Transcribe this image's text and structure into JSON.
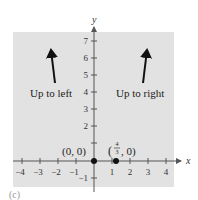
{
  "figure": {
    "panel_label": "(c)",
    "background_color": "#e2e2e2",
    "axis_color": "#555555",
    "x_axis": {
      "label": "x",
      "ticks": [
        "−4",
        "−3",
        "−2",
        "−1",
        "1",
        "2",
        "3",
        "4"
      ]
    },
    "y_axis": {
      "label": "y",
      "ticks": [
        "7",
        "6",
        "5",
        "4",
        "3",
        "2",
        "−1"
      ]
    },
    "annotations": {
      "left_arrow_label": "Up to left",
      "right_arrow_label": "Up to right",
      "origin_label": "(0, 0)",
      "point2_label_num": "4",
      "point2_label_den": "3",
      "point2_label_rest": ", 0)",
      "point2_label_open": "("
    },
    "points": [
      {
        "name": "origin",
        "x": 0,
        "y": 0
      },
      {
        "name": "x-intercept",
        "x": 1.333,
        "y": 0
      }
    ]
  }
}
